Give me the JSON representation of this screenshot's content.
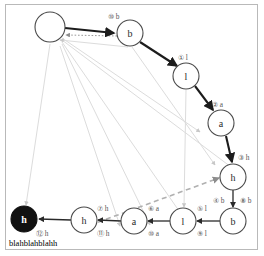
{
  "figure": {
    "caption": "blahblahblahh",
    "border_color": "#b9b9b9",
    "background": "#ffffff"
  },
  "colors": {
    "node_stroke": "#4a4a4a",
    "node_fill": "#ffffff",
    "accept_fill": "#111111",
    "edge_main": "#1c1c1c",
    "edge_faint": "#dcdcdc",
    "edge_dashed": "#b0b0b0",
    "label": "#555555"
  },
  "nodes": [
    {
      "id": "n0",
      "label": "",
      "cx": 50,
      "cy": 27,
      "r": 15,
      "filled": false
    },
    {
      "id": "n1",
      "label": "b",
      "cx": 130,
      "cy": 33,
      "r": 13,
      "filled": false
    },
    {
      "id": "n2",
      "label": "l",
      "cx": 186,
      "cy": 76,
      "r": 13,
      "filled": false
    },
    {
      "id": "n3",
      "label": "a",
      "cx": 221,
      "cy": 123,
      "r": 13,
      "filled": false
    },
    {
      "id": "n4",
      "label": "h",
      "cx": 233,
      "cy": 177,
      "r": 13,
      "filled": false
    },
    {
      "id": "n5",
      "label": "b",
      "cx": 233,
      "cy": 221,
      "r": 13,
      "filled": false
    },
    {
      "id": "n6",
      "label": "l",
      "cx": 183,
      "cy": 221,
      "r": 13,
      "filled": false
    },
    {
      "id": "n7",
      "label": "a",
      "cx": 134,
      "cy": 221,
      "r": 13,
      "filled": false
    },
    {
      "id": "n8",
      "label": "h",
      "cx": 84,
      "cy": 220,
      "r": 13,
      "filled": false
    },
    {
      "id": "n9",
      "label": "h",
      "cx": 24,
      "cy": 219,
      "r": 13,
      "filled": true
    }
  ],
  "edge_labels": [
    {
      "text": "⑩ b",
      "x": 108,
      "y": 16,
      "anchor": "start"
    },
    {
      "text": "① l",
      "x": 178,
      "y": 57,
      "anchor": "start"
    },
    {
      "text": "② a",
      "x": 212,
      "y": 104,
      "anchor": "start"
    },
    {
      "text": "③ h",
      "x": 238,
      "y": 157,
      "anchor": "start"
    },
    {
      "text": "④ b",
      "x": 213,
      "y": 200,
      "anchor": "start"
    },
    {
      "text": "⑧ b",
      "x": 240,
      "y": 200,
      "anchor": "start"
    },
    {
      "text": "⑤ l",
      "x": 197,
      "y": 208,
      "anchor": "start"
    },
    {
      "text": "⑨ l",
      "x": 197,
      "y": 233,
      "anchor": "start"
    },
    {
      "text": "⑥ a",
      "x": 148,
      "y": 208,
      "anchor": "start"
    },
    {
      "text": "⑩ a",
      "x": 148,
      "y": 233,
      "anchor": "start"
    },
    {
      "text": "⑦ h",
      "x": 97,
      "y": 208,
      "anchor": "start"
    },
    {
      "text": "⑪ h",
      "x": 97,
      "y": 233,
      "anchor": "start"
    },
    {
      "text": "⑫ h",
      "x": 36,
      "y": 233,
      "anchor": "start"
    }
  ],
  "edges_main": [
    {
      "name": "edge-n0-b",
      "d": "M 65,28 L 114,33"
    },
    {
      "name": "edge-b-l",
      "d": "M 140,42 L 177,66"
    },
    {
      "name": "edge-l-a",
      "d": "M 195,86 L 213,110"
    },
    {
      "name": "edge-a-h",
      "d": "M 226,136 L 232,162"
    }
  ],
  "edges_thin": [
    {
      "name": "edge-h-b-down",
      "d": "M 233,190 L 233,207"
    },
    {
      "name": "edge-b-l-bot",
      "d": "M 220,221 L 197,221"
    },
    {
      "name": "edge-l-a-bot",
      "d": "M 170,221 L 148,221"
    },
    {
      "name": "edge-a-h-bot",
      "d": "M 121,221 L 98,220"
    },
    {
      "name": "edge-h-accept",
      "d": "M 71,220 L 39,219"
    }
  ],
  "edges_faint": [
    {
      "name": "faint-fan-1",
      "d": "M 62,38 L 200,132"
    },
    {
      "name": "faint-fan-2",
      "d": "M 62,40 L 235,170"
    },
    {
      "name": "faint-fan-3",
      "d": "M 62,42 L 186,221"
    },
    {
      "name": "faint-fan-4",
      "d": "M 62,44 L 150,225"
    },
    {
      "name": "faint-fan-5",
      "d": "M 60,46 L 120,226"
    },
    {
      "name": "faint-accept-up",
      "d": "M 50,44 L 26,205"
    },
    {
      "name": "faint-l-vert",
      "d": "M 186,90 L 184,207"
    },
    {
      "name": "faint-b-down",
      "d": "M 132,47 L 215,165"
    },
    {
      "name": "faint-b-cross",
      "d": "M 128,47 L 60,40"
    }
  ],
  "edges_dotted": [
    {
      "name": "dotted-b-to-n0",
      "d": "M 117,36 L 66,35"
    }
  ],
  "edges_dashed": [
    {
      "name": "dashed-h-to-h",
      "d": "M 82,228 L 219,178"
    }
  ]
}
